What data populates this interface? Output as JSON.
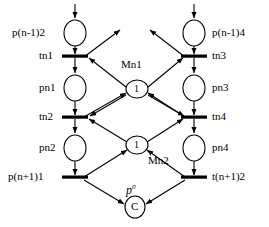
{
  "diagram": {
    "type": "petri-net",
    "title": "",
    "places": [
      {
        "id": "p_n_1_2",
        "label": "p(n-1)2",
        "cx": 75,
        "cy": 33,
        "rx": 11,
        "ry": 13,
        "token": ""
      },
      {
        "id": "pn1",
        "label": "pn1",
        "cx": 75,
        "cy": 88,
        "rx": 11,
        "ry": 13,
        "token": ""
      },
      {
        "id": "pn2",
        "label": "pn2",
        "cx": 75,
        "cy": 148,
        "rx": 11,
        "ry": 13,
        "token": ""
      },
      {
        "id": "p_n_1_4",
        "label": "p(n-1)4",
        "cx": 194,
        "cy": 33,
        "rx": 11,
        "ry": 13,
        "token": ""
      },
      {
        "id": "pn3",
        "label": "pn3",
        "cx": 194,
        "cy": 88,
        "rx": 11,
        "ry": 13,
        "token": ""
      },
      {
        "id": "pn4",
        "label": "pn4",
        "cx": 194,
        "cy": 148,
        "rx": 11,
        "ry": 13,
        "token": ""
      },
      {
        "id": "Mn1",
        "label": "Mn1",
        "cx": 137,
        "cy": 89,
        "rx": 11,
        "ry": 9,
        "token": "1"
      },
      {
        "id": "Mn2",
        "label": "Mn2",
        "cx": 137,
        "cy": 145,
        "rx": 11,
        "ry": 9,
        "token": "1"
      },
      {
        "id": "p0",
        "label": "p",
        "cx": 135,
        "cy": 207,
        "rx": 10,
        "ry": 11,
        "token": "C"
      }
    ],
    "transitions": [
      {
        "id": "tn1",
        "label": "tn1",
        "cx": 75,
        "cy": 56,
        "w": 26,
        "h": 3
      },
      {
        "id": "tn2",
        "label": "tn2",
        "cx": 75,
        "cy": 117,
        "w": 26,
        "h": 3
      },
      {
        "id": "tn_1_1",
        "label": "p(n+1)1",
        "cx": 75,
        "cy": 177,
        "w": 26,
        "h": 3
      },
      {
        "id": "tn3",
        "label": "tn3",
        "cx": 194,
        "cy": 56,
        "w": 26,
        "h": 3
      },
      {
        "id": "tn4",
        "label": "tn4",
        "cx": 194,
        "cy": 117,
        "w": 26,
        "h": 3
      },
      {
        "id": "tn_1_2",
        "label": "t(n+1)2",
        "cx": 194,
        "cy": 177,
        "w": 26,
        "h": 3
      }
    ],
    "labels": {
      "p_n_1_2": {
        "text": "p(n-1)2",
        "x": 12,
        "y": 28
      },
      "tn1": {
        "text": "tn1",
        "x": 38,
        "y": 51
      },
      "pn1": {
        "text": "pn1",
        "x": 38,
        "y": 83
      },
      "tn2": {
        "text": "tn2",
        "x": 38,
        "y": 112
      },
      "pn2": {
        "text": "pn2",
        "x": 38,
        "y": 143
      },
      "p_n_1_1": {
        "text": "p(n+1)1",
        "x": 10,
        "y": 172
      },
      "p_n_1_4": {
        "text": "p(n-1)4",
        "x": 213,
        "y": 28
      },
      "tn3": {
        "text": "tn3",
        "x": 213,
        "y": 51
      },
      "pn3": {
        "text": "pn3",
        "x": 213,
        "y": 83
      },
      "tn4": {
        "text": "tn4",
        "x": 213,
        "y": 112
      },
      "pn4": {
        "text": "pn4",
        "x": 213,
        "y": 143
      },
      "t_n_1_2": {
        "text": "t(n+1)2",
        "x": 213,
        "y": 172
      },
      "Mn1": {
        "text": "Mn1",
        "x": 122,
        "y": 60
      },
      "Mn2": {
        "text": "Mn2",
        "x": 148,
        "y": 156
      },
      "p0_base": {
        "text": "p",
        "x": 127,
        "y": 185
      },
      "p0_sup": {
        "text": "0"
      }
    },
    "tokens": {
      "Mn1_token": "1",
      "Mn2_token": "1",
      "p0_token": "C"
    },
    "colors": {
      "stroke": "#000000",
      "background": "#ffffff",
      "text": "#000000"
    }
  }
}
